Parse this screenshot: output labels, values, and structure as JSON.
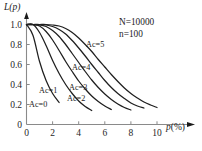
{
  "chart_data": {
    "type": "line",
    "title": "",
    "xlabel": "p(%)",
    "ylabel": "L(p)",
    "xlim": [
      0,
      11
    ],
    "ylim": [
      0,
      1.08
    ],
    "xticks": [
      "0",
      "2",
      "4",
      "6",
      "8",
      "10"
    ],
    "xtick_values": [
      0,
      2,
      4,
      6,
      8,
      10
    ],
    "yticks": [
      "0",
      "0.2",
      "0.4",
      "0.6",
      "0.8",
      "1.0"
    ],
    "ytick_values": [
      0,
      0.2,
      0.4,
      0.6,
      0.8,
      1.0
    ],
    "grid": false,
    "legend_position": "inline-curve-labels",
    "annotations": [
      {
        "name": "sample-params-N",
        "text": "N=10000"
      },
      {
        "name": "sample-params-n",
        "text": "n=100"
      }
    ],
    "x": [
      0,
      0.5,
      1,
      1.5,
      2,
      2.5,
      3,
      3.5,
      4,
      4.5,
      5,
      5.5,
      6,
      6.5,
      7,
      7.5,
      8,
      8.5,
      9,
      9.5,
      10,
      10.5
    ],
    "series": [
      {
        "name": "Ac=0",
        "label": "Ac=0",
        "values": [
          1.0,
          0.89,
          0.63,
          0.44,
          0.31,
          0.22,
          0.155,
          0.11,
          0.078,
          0.057,
          0.042,
          0.032,
          0.025,
          0.02,
          0.017,
          0.015,
          0.013,
          0.012,
          0.011,
          0.01,
          0.01,
          0.01
        ]
      },
      {
        "name": "Ac=1",
        "label": "Ac=1",
        "values": [
          1.0,
          1.0,
          0.92,
          0.79,
          0.64,
          0.51,
          0.4,
          0.31,
          0.235,
          0.18,
          0.14,
          0.108,
          0.085,
          0.068,
          0.057,
          0.05,
          0.045,
          0.042,
          0.04,
          0.039,
          0.038,
          0.038
        ]
      },
      {
        "name": "Ac=2",
        "label": "Ac=2",
        "values": [
          1.0,
          1.0,
          0.985,
          0.93,
          0.845,
          0.74,
          0.63,
          0.53,
          0.435,
          0.355,
          0.285,
          0.23,
          0.185,
          0.15,
          0.125,
          0.107,
          0.095,
          0.088,
          0.083,
          0.08,
          0.078,
          0.078
        ]
      },
      {
        "name": "Ac=3",
        "label": "Ac=3",
        "values": [
          1.0,
          1.0,
          0.997,
          0.98,
          0.94,
          0.88,
          0.8,
          0.71,
          0.62,
          0.53,
          0.445,
          0.37,
          0.305,
          0.25,
          0.205,
          0.17,
          0.145,
          0.13,
          0.12,
          0.114,
          0.11,
          0.11
        ]
      },
      {
        "name": "Ac=4",
        "label": "Ac=4",
        "values": [
          1.0,
          1.0,
          1.0,
          0.995,
          0.98,
          0.95,
          0.905,
          0.84,
          0.765,
          0.685,
          0.6,
          0.52,
          0.44,
          0.37,
          0.31,
          0.26,
          0.215,
          0.185,
          0.165,
          0.152,
          0.145,
          0.143
        ]
      },
      {
        "name": "Ac=5",
        "label": "Ac=5",
        "values": [
          1.0,
          1.0,
          1.0,
          1.0,
          0.995,
          0.985,
          0.96,
          0.92,
          0.865,
          0.8,
          0.73,
          0.65,
          0.575,
          0.5,
          0.43,
          0.365,
          0.31,
          0.265,
          0.225,
          0.195,
          0.17,
          0.158
        ]
      }
    ]
  },
  "axis": {
    "y_label": "L(p)",
    "y_label_main": "L",
    "y_label_paren": "(p)",
    "x_label": "p(%)",
    "x_label_main": "p",
    "x_label_unit": "(%)"
  },
  "style": {
    "curve_color": "#1f1f1f",
    "axis_color": "#8a8a8a",
    "text_color": "#1a1a1a",
    "background": "#ffffff"
  }
}
